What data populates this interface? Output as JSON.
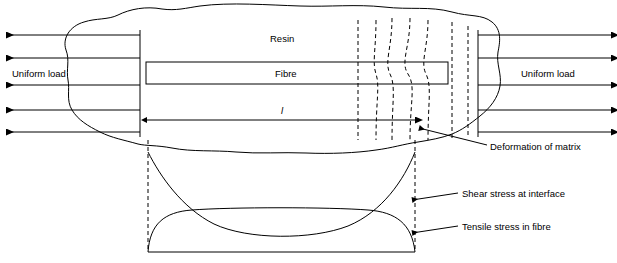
{
  "figure": {
    "labels": {
      "resin": "Resin",
      "fibre": "Fibre",
      "uniform_load_left": "Uniform load",
      "uniform_load_right": "Uniform load",
      "length_symbol": "l",
      "deformation_of_matrix": "Deformation of matrix",
      "shear_stress_at_interface": "Shear stress at interface",
      "tensile_stress_in_fibre": "Tensile stress in fibre"
    },
    "colors": {
      "stroke": "#000000",
      "background": "#ffffff"
    },
    "elements": {
      "left_arrows_count": 5,
      "right_arrows_count": 5,
      "dashed_vertical_lines_count": 7
    }
  }
}
